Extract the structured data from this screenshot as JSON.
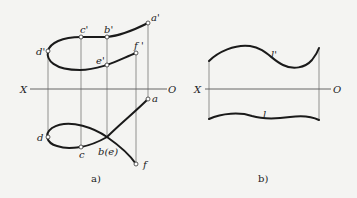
{
  "figure_a": {
    "caption": "a)",
    "axis": {
      "left_label": "X",
      "right_label": "O"
    },
    "front_view_points": {
      "a_prime": "a'",
      "b_prime": "b'",
      "c_prime": "c'",
      "d_prime": "d'",
      "e_prime": "e'",
      "f_prime": "f '"
    },
    "top_view_points": {
      "a": "a",
      "b_e": "b(e)",
      "c": "c",
      "d": "d",
      "f": "f"
    }
  },
  "figure_b": {
    "caption": "b)",
    "axis": {
      "left_label": "X",
      "right_label": "O"
    },
    "front_curve_label": "l'",
    "top_curve_label": "l"
  },
  "colors": {
    "background": "#f4f4f2",
    "curve": "#1a1a1a",
    "axis": "#555555"
  }
}
